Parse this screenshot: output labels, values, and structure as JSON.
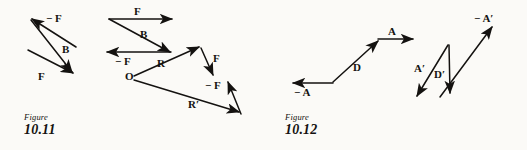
{
  "page": {
    "background_color": "#fbfaf7",
    "ink_color": "#141210",
    "width": 527,
    "height": 150
  },
  "figures": [
    {
      "id": "figure-10-11",
      "caption_word": "Figure",
      "caption_number": "10.11",
      "caption_x": 24,
      "caption_y": 113,
      "diagrams": [
        {
          "id": "subtraction-triangle",
          "vectors": [
            {
              "name": "minus-F",
              "label": "− F",
              "x1": 76,
              "y1": 47,
              "x2": 32,
              "y2": 19,
              "label_x": 46,
              "label_y": 13
            },
            {
              "name": "B",
              "label": "B",
              "x1": 31,
              "y1": 20,
              "x2": 72,
              "y2": 72,
              "label_x": 62,
              "label_y": 44
            },
            {
              "name": "F",
              "label": "F",
              "x1": 28,
              "y1": 50,
              "x2": 73,
              "y2": 73,
              "label_x": 38,
              "label_y": 71
            }
          ]
        },
        {
          "id": "head-to-tail-sum",
          "vectors": [
            {
              "name": "F-top",
              "label": "F",
              "x1": 109,
              "y1": 19,
              "x2": 172,
              "y2": 19,
              "label_x": 134,
              "label_y": 6
            },
            {
              "name": "B-diagonal",
              "label": "B",
              "x1": 109,
              "y1": 19,
              "x2": 170,
              "y2": 52,
              "label_x": 140,
              "label_y": 29
            },
            {
              "name": "minus-F-bottom",
              "label": "− F",
              "x1": 171,
              "y1": 52,
              "x2": 107,
              "y2": 52,
              "label_x": 115,
              "label_y": 56
            }
          ]
        },
        {
          "id": "resultant-triangle",
          "origin_label": "O",
          "origin_x": 125,
          "origin_y": 71,
          "vectors": [
            {
              "name": "R",
              "label": "R",
              "x1": 134,
              "y1": 76,
              "x2": 199,
              "y2": 47,
              "label_x": 157,
              "label_y": 58
            },
            {
              "name": "F-right",
              "label": "F",
              "x1": 201,
              "y1": 48,
              "x2": 213,
              "y2": 75,
              "label_x": 213,
              "label_y": 53
            },
            {
              "name": "R-prime",
              "label": "R′",
              "x1": 134,
              "y1": 80,
              "x2": 239,
              "y2": 112,
              "label_x": 188,
              "label_y": 99
            },
            {
              "name": "minus-F-right",
              "label": "− F",
              "x1": 241,
              "y1": 114,
              "x2": 228,
              "y2": 82,
              "label_x": 205,
              "label_y": 80
            }
          ]
        }
      ]
    },
    {
      "id": "figure-10-12",
      "caption_word": "Figure",
      "caption_number": "10.12",
      "caption_x": 285,
      "caption_y": 113,
      "diagrams": [
        {
          "id": "displacement-A-D",
          "vectors": [
            {
              "name": "D",
              "label": "D",
              "x1": 333,
              "y1": 82,
              "x2": 378,
              "y2": 41,
              "label_x": 353,
              "label_y": 62
            },
            {
              "name": "A-top",
              "label": "A",
              "x1": 378,
              "y1": 39,
              "x2": 413,
              "y2": 39,
              "label_x": 388,
              "label_y": 26
            },
            {
              "name": "minus-A",
              "label": "− A",
              "x1": 333,
              "y1": 83,
              "x2": 293,
              "y2": 83,
              "label_x": 294,
              "label_y": 87
            }
          ]
        },
        {
          "id": "displacement-A-prime-D-prime",
          "vectors": [
            {
              "name": "A-prime",
              "label": "A′",
              "x1": 448,
              "y1": 45,
              "x2": 417,
              "y2": 96,
              "label_x": 414,
              "label_y": 63
            },
            {
              "name": "D-prime",
              "label": "D′",
              "x1": 449,
              "y1": 45,
              "x2": 450,
              "y2": 93,
              "label_x": 434,
              "label_y": 69
            },
            {
              "name": "minus-A-prime",
              "label": "− A′",
              "x1": 440,
              "y1": 97,
              "x2": 492,
              "y2": 27,
              "label_x": 474,
              "label_y": 13
            }
          ]
        }
      ]
    }
  ]
}
